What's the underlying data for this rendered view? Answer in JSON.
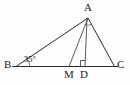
{
  "figure": {
    "kind": "geometry-diagram",
    "shape": "triangle",
    "background_color": "#fdfdfd",
    "stroke_color": "#2b2b2b"
  },
  "labels": {
    "vertex_a": "A",
    "vertex_b": "B",
    "vertex_c": "C",
    "point_m": "M",
    "point_d": "D",
    "angle_b": "35°"
  },
  "geometry": {
    "points": {
      "A": [
        88,
        18
      ],
      "B": [
        16,
        66
      ],
      "C": [
        114,
        66
      ],
      "M": [
        69,
        66
      ],
      "D": [
        85,
        66
      ]
    },
    "segments": [
      {
        "name": "side-ab",
        "from": "B",
        "to": "A"
      },
      {
        "name": "side-ac",
        "from": "A",
        "to": "C"
      },
      {
        "name": "side-bc",
        "from": "B",
        "to": "C"
      },
      {
        "name": "cevian-am",
        "from": "A",
        "to": "M"
      },
      {
        "name": "altitude-ad",
        "from": "A",
        "to": "D"
      }
    ],
    "marks": {
      "right_angle_at": "D",
      "angle_arc_at_b": "35°",
      "angle_arc_at_a": true
    }
  }
}
